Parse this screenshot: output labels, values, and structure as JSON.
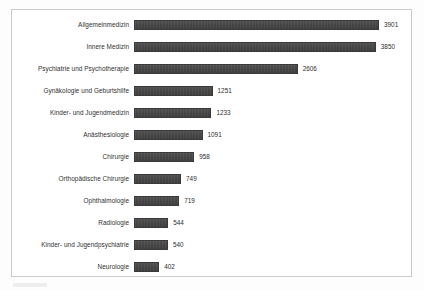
{
  "chart_data": {
    "type": "bar",
    "orientation": "horizontal",
    "title": "",
    "subtitle": "",
    "xlabel": "",
    "ylabel": "",
    "grid": false,
    "legend": null,
    "legend_position": "none",
    "axis_visible": false,
    "tick_labels": [],
    "xlim": [
      0,
      3901
    ],
    "value_labels_shown": true,
    "bar_color": "#464646",
    "border_color": "#c9c9c9",
    "text_color": "#303030",
    "categories": [
      "Allgemeinmedizin",
      "Innere Medizin",
      "Psychiatrie und Psychotherapie",
      "Gynäkologie und Geburtshilfe",
      "Kinder- und Jugendmedizin",
      "Anästhesiologie",
      "Chirurgie",
      "Orthopädische Chirurgie",
      "Ophthalmologie",
      "Radiologie",
      "Kinder- und Jugendpsychiatrie",
      "Neurologie"
    ],
    "values": [
      3901,
      3850,
      2606,
      1251,
      1233,
      1091,
      958,
      749,
      719,
      544,
      540,
      402
    ]
  }
}
